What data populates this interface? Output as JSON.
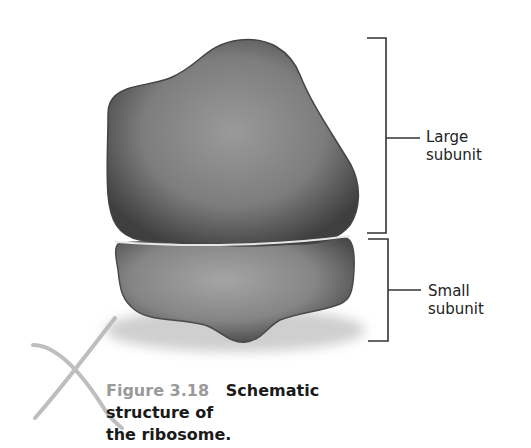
{
  "figure": {
    "number": "Figure 3.18",
    "caption_line1": "Schematic structure of",
    "caption_line2": "the ribosome.",
    "labels": {
      "large": {
        "line1": "Large",
        "line2": "subunit"
      },
      "small": {
        "line1": "Small",
        "line2": "subunit"
      }
    },
    "colors": {
      "subunit_dark": "#3a3a3a",
      "subunit_mid": "#8c8c8c",
      "subunit_light": "#b5b5b5",
      "bracket": "#333333",
      "figure_number": "#9a9a9a",
      "pencil_mark": "#b0b0b0"
    }
  }
}
